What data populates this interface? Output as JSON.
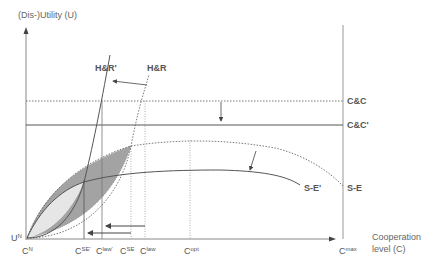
{
  "diagram": {
    "y_axis_label": "(Dis-)Utility (U)",
    "x_axis_label_line1": "Cooperation",
    "x_axis_label_line2": "level (C)",
    "origin_label": {
      "base": "U",
      "sup": "N"
    },
    "curves": {
      "hr_prime": "H&R'",
      "hr": "H&R",
      "cc": "C&C",
      "cc_prime": "C&C'",
      "se_prime": "S-E'",
      "se": "S-E"
    },
    "x_ticks": [
      {
        "base": "C",
        "sup": "N"
      },
      {
        "base": "C",
        "sup": "SE'"
      },
      {
        "base": "C",
        "sup": "law'"
      },
      {
        "base": "C",
        "sup": "SE"
      },
      {
        "base": "C",
        "sup": "law"
      },
      {
        "base": "C",
        "sup": "opt"
      },
      {
        "base": "C",
        "sup": "max"
      }
    ],
    "colors": {
      "axis": "#888888",
      "curve": "#555555",
      "shade_dark": "#a0a0a0",
      "shade_light": "#e4e4e4"
    }
  }
}
